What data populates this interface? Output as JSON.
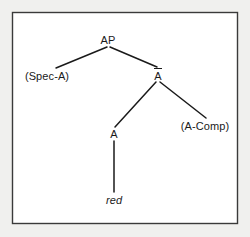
{
  "figure": {
    "kind": "x-bar-syntax-tree",
    "background_color": "#f0f0ee",
    "canvas_color": "#ffffff",
    "border_color": "#3a3a3a",
    "line_color": "#1a1a1a",
    "text_color": "#1a1a1a"
  },
  "tree": {
    "root": {
      "label": "AP",
      "name": "node-ap"
    },
    "specifier": {
      "label": "(Spec-A)",
      "name": "node-spec-a"
    },
    "bar_level": {
      "label": "A",
      "overbar": true,
      "name": "node-a-bar"
    },
    "head": {
      "label": "A",
      "name": "node-a-head"
    },
    "complement": {
      "label": "(A-Comp)",
      "name": "node-a-comp"
    },
    "terminal": {
      "label": "red",
      "style": "italic",
      "name": "node-terminal-red"
    }
  }
}
